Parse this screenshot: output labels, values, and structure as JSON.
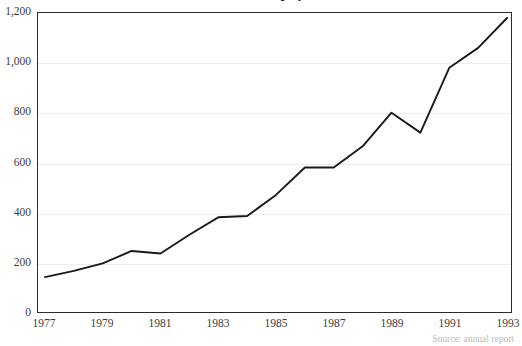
{
  "figure": {
    "title_clipped": "Number of employees",
    "source_note_clipped": "Source: annual report"
  },
  "chart_data": {
    "type": "line",
    "title": "",
    "xlabel": "",
    "ylabel": "",
    "grid": true,
    "legend": "none",
    "xlim": [
      1977,
      1993
    ],
    "ylim": [
      0,
      1200
    ],
    "x": [
      1977,
      1978,
      1979,
      1980,
      1981,
      1982,
      1983,
      1984,
      1985,
      1986,
      1987,
      1988,
      1989,
      1990,
      1991,
      1992,
      1993
    ],
    "values": [
      140,
      165,
      195,
      245,
      235,
      310,
      380,
      385,
      470,
      580,
      580,
      665,
      800,
      720,
      980,
      1060,
      1180
    ],
    "series": [
      {
        "name": "series-1",
        "color": "#1a1a1a",
        "values": [
          140,
          165,
          195,
          245,
          235,
          310,
          380,
          385,
          470,
          580,
          580,
          665,
          800,
          720,
          980,
          1060,
          1180
        ]
      }
    ],
    "x_tick_labels": [
      "1977",
      "1979",
      "1981",
      "1983",
      "1985",
      "1987",
      "1989",
      "1991",
      "1993"
    ],
    "x_tick_values": [
      1977,
      1979,
      1981,
      1983,
      1985,
      1987,
      1989,
      1991,
      1993
    ],
    "y_tick_labels": [
      "0",
      "200",
      "400",
      "600",
      "800",
      "1,000",
      "1,200"
    ],
    "y_tick_values": [
      0,
      200,
      400,
      600,
      800,
      1000,
      1200
    ]
  },
  "colors": {
    "line": "#1a1a1a",
    "frame": "#2b2b2b",
    "grid": "#ededed",
    "background": "#ffffff",
    "tick_text": "#3d3d3d"
  }
}
